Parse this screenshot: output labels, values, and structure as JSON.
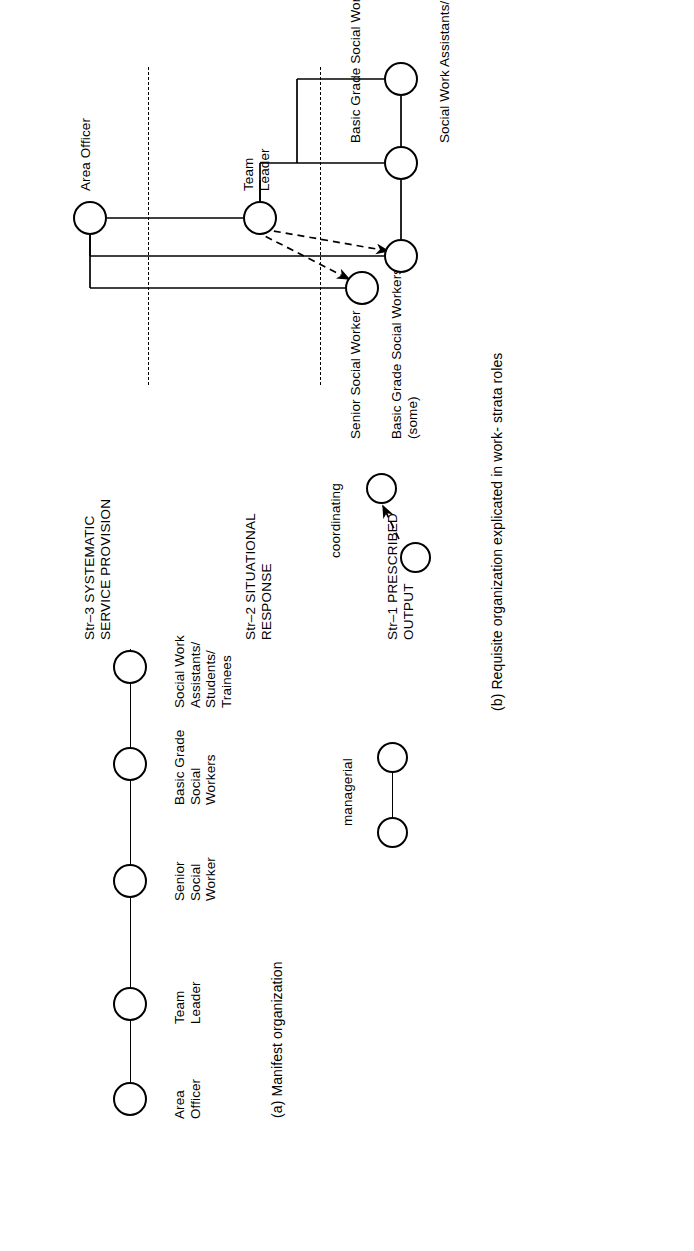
{
  "figure": {
    "panel_a": {
      "caption": "(a) Manifest organization",
      "roles": [
        {
          "id": "area-officer",
          "label": "Area\nOfficer"
        },
        {
          "id": "team-leader",
          "label": "Team\nLeader"
        },
        {
          "id": "senior-social-worker",
          "label": "Senior\nSocial\nWorker"
        },
        {
          "id": "basic-grade-social-workers",
          "label": "Basic Grade\nSocial\nWorkers"
        },
        {
          "id": "social-work-assistants",
          "label": "Social Work\nAssistants/\nStudents/\nTrainees"
        }
      ]
    },
    "legend": {
      "managerial": "managerial",
      "coordinating": "coordinating"
    },
    "panel_b": {
      "caption": "(b) Requisite organization explicated in work- strata roles",
      "strata": [
        {
          "id": "str-3",
          "label": "Str–3 SYSTEMATIC\nSERVICE PROVISION"
        },
        {
          "id": "str-2",
          "label": "Str–2 SITUATIONAL\nRESPONSE"
        },
        {
          "id": "str-1",
          "label": "Str–1 PRESCRIBED\nOUTPUT"
        }
      ],
      "roles": [
        {
          "id": "area-officer",
          "label": "Area Officer"
        },
        {
          "id": "team-leader",
          "label": "Team\nLeader"
        },
        {
          "id": "senior-social-worker",
          "label": "Senior Social Worker"
        },
        {
          "id": "basic-grade-some",
          "label": "Basic Grade Social Workers\n(some)"
        },
        {
          "id": "basic-grade-other",
          "label": "Basic Grade Social Workers (other)"
        },
        {
          "id": "social-work-assistants",
          "label": "Social Work Assistants/Students/Trainees"
        }
      ]
    }
  }
}
